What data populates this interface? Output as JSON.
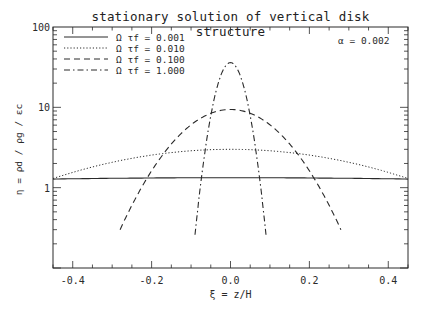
{
  "chart_data": {
    "type": "line",
    "title": "stationary solution of vertical disk structure",
    "xlabel": "ξ = z/H",
    "ylabel": "η = ρd / ρg / εc",
    "xlim": [
      -0.45,
      0.45
    ],
    "ylim": [
      0.1,
      100
    ],
    "yscale": "log",
    "grid": false,
    "xticks": [
      -0.4,
      -0.2,
      0.0,
      0.2,
      0.4
    ],
    "xtick_labels": [
      "-0.4",
      "-0.2",
      "0.0",
      "0.2",
      "0.4"
    ],
    "yticks": [
      1,
      10,
      100
    ],
    "ytick_labels": [
      "1",
      "10",
      "100"
    ],
    "legend_position": "upper left",
    "annotation": "α = 0.002",
    "series": [
      {
        "name": "Ω τf = 0.001",
        "style": "solid",
        "peak": 1.33,
        "x": [
          -0.45,
          -0.3,
          -0.15,
          0.0,
          0.15,
          0.3,
          0.45
        ],
        "values": [
          1.28,
          1.31,
          1.32,
          1.33,
          1.32,
          1.31,
          1.28
        ]
      },
      {
        "name": "Ω τf = 0.010",
        "style": "dotted",
        "peak": 3.0,
        "x": [
          -0.45,
          -0.3,
          -0.15,
          0.0,
          0.15,
          0.3,
          0.45
        ],
        "values": [
          1.3,
          1.9,
          2.6,
          3.0,
          2.6,
          1.9,
          1.3
        ]
      },
      {
        "name": "Ω τf = 0.100",
        "style": "dashed",
        "peak": 9.4,
        "x": [
          -0.28,
          -0.2,
          -0.1,
          0.0,
          0.1,
          0.2,
          0.28
        ],
        "values": [
          0.3,
          1.2,
          5.5,
          9.4,
          5.5,
          1.2,
          0.3
        ]
      },
      {
        "name": "Ω τf = 1.000",
        "style": "dashdot",
        "peak": 36,
        "x": [
          -0.09,
          -0.06,
          -0.03,
          0.0,
          0.03,
          0.06,
          0.09
        ],
        "values": [
          0.26,
          2.5,
          16,
          36,
          16,
          2.5,
          0.26
        ]
      }
    ]
  },
  "legend": {
    "items": [
      {
        "label": "Ω τf = 0.001"
      },
      {
        "label": "Ω τf = 0.010"
      },
      {
        "label": "Ω τf = 0.100"
      },
      {
        "label": "Ω τf = 1.000"
      }
    ]
  },
  "annotation_text": "α  =  0.002"
}
